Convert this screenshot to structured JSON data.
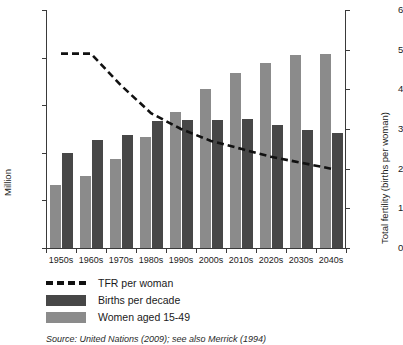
{
  "chart_data": {
    "type": "bar",
    "title": "",
    "categories": [
      "1950s",
      "1960s",
      "1970s",
      "1980s",
      "1990s",
      "2000s",
      "2010s",
      "2020s",
      "2030s",
      "2040s"
    ],
    "xlabel": "",
    "ylabel": "Million",
    "ylabel_right": "Total fertility (births per woman)",
    "ylim": [
      0,
      2500
    ],
    "ylim_right": [
      0,
      6
    ],
    "yticks": [
      0,
      500,
      1000,
      1500,
      2000,
      2500
    ],
    "ytick_labels": [
      "0",
      "500",
      "1,000",
      "1,500",
      "2,000",
      "2,500"
    ],
    "yticks_right": [
      0,
      1,
      2,
      3,
      4,
      5,
      6
    ],
    "ytick_labels_right": [
      "0",
      "1",
      "2",
      "3",
      "4",
      "5",
      "6"
    ],
    "grid": false,
    "legend_position": "below-left",
    "series": [
      {
        "name": "TFR per woman",
        "type": "line",
        "style": "dashed",
        "axis": "right",
        "color": "#111111",
        "values": [
          4.9,
          4.9,
          4.1,
          3.4,
          3.0,
          2.7,
          2.5,
          2.3,
          2.15,
          2.0
        ]
      },
      {
        "name": "Births per decade",
        "type": "bar",
        "axis": "left",
        "color": "#474747",
        "values": [
          1000,
          1130,
          1190,
          1330,
          1340,
          1340,
          1360,
          1290,
          1240,
          1210
        ]
      },
      {
        "name": "Women aged 15-49",
        "type": "bar",
        "axis": "left",
        "color": "#8b8b8b",
        "values": [
          660,
          760,
          940,
          1170,
          1430,
          1670,
          1840,
          1940,
          2030,
          2040
        ]
      }
    ]
  },
  "legend": {
    "items": [
      {
        "label": "TFR per woman",
        "key": "dashed-line",
        "color": "#111111"
      },
      {
        "label": "Births per decade",
        "key": "swatch-dark",
        "color": "#474747"
      },
      {
        "label": "Women aged 15-49",
        "key": "swatch-light",
        "color": "#8b8b8b"
      }
    ]
  },
  "source": {
    "text": "Source: United Nations (2009); see also Merrick (1994)"
  }
}
